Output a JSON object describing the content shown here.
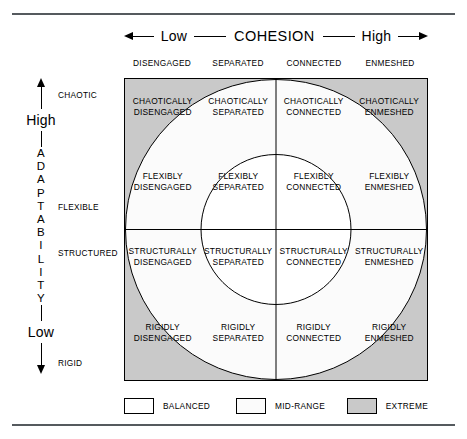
{
  "cohesion_axis": {
    "low_label": "Low",
    "title": "COHESION",
    "high_label": "High",
    "left_arrow_icon": "arrow-left-icon",
    "right_arrow_icon": "arrow-right-icon"
  },
  "adaptability_axis": {
    "high_label": "High",
    "low_label": "Low",
    "letters": [
      "A",
      "D",
      "A",
      "P",
      "T",
      "A",
      "B",
      "I",
      "L",
      "I",
      "T",
      "Y"
    ],
    "up_arrow_icon": "arrow-up-icon",
    "down_arrow_icon": "arrow-down-icon"
  },
  "columns": [
    {
      "label": "DISENGAGED"
    },
    {
      "label": "SEPARATED"
    },
    {
      "label": "CONNECTED"
    },
    {
      "label": "ENMESHED"
    }
  ],
  "rows": [
    {
      "label": "CHAOTIC"
    },
    {
      "label": "FLEXIBLE"
    },
    {
      "label": "STRUCTURED"
    },
    {
      "label": "RIGID"
    }
  ],
  "cells": [
    {
      "line1": "CHAOTICALLY",
      "line2": "DISENGAGED",
      "zone": "extreme"
    },
    {
      "line1": "CHAOTICALLY",
      "line2": "SEPARATED",
      "zone": "mid-range"
    },
    {
      "line1": "CHAOTICALLY",
      "line2": "CONNECTED",
      "zone": "mid-range"
    },
    {
      "line1": "CHAOTICALLY",
      "line2": "ENMESHED",
      "zone": "extreme"
    },
    {
      "line1": "FLEXIBLY",
      "line2": "DISENGAGED",
      "zone": "mid-range"
    },
    {
      "line1": "FLEXIBLY",
      "line2": "SEPARATED",
      "zone": "balanced"
    },
    {
      "line1": "FLEXIBLY",
      "line2": "CONNECTED",
      "zone": "balanced"
    },
    {
      "line1": "FLEXIBLY",
      "line2": "ENMESHED",
      "zone": "mid-range"
    },
    {
      "line1": "STRUCTURALLY",
      "line2": "DISENGAGED",
      "zone": "mid-range"
    },
    {
      "line1": "STRUCTURALLY",
      "line2": "SEPARATED",
      "zone": "balanced"
    },
    {
      "line1": "STRUCTURALLY",
      "line2": "CONNECTED",
      "zone": "balanced"
    },
    {
      "line1": "STRUCTURALLY",
      "line2": "ENMESHED",
      "zone": "mid-range"
    },
    {
      "line1": "RIGIDLY",
      "line2": "DISENGAGED",
      "zone": "extreme"
    },
    {
      "line1": "RIGIDLY",
      "line2": "SEPARATED",
      "zone": "mid-range"
    },
    {
      "line1": "RIGIDLY",
      "line2": "CONNECTED",
      "zone": "mid-range"
    },
    {
      "line1": "RIGIDLY",
      "line2": "ENMESHED",
      "zone": "extreme"
    }
  ],
  "legend": [
    {
      "label": "BALANCED",
      "color": "#ffffff"
    },
    {
      "label": "MID-RANGE",
      "color": "#fbfbfb"
    },
    {
      "label": "EXTREME",
      "color": "#c9c9c9"
    }
  ],
  "colors": {
    "extreme_gray": "#c9c9c9",
    "mid_range": "#fbfbfb",
    "balanced": "#ffffff",
    "stroke": "#000000",
    "rule": "#555a5e"
  }
}
